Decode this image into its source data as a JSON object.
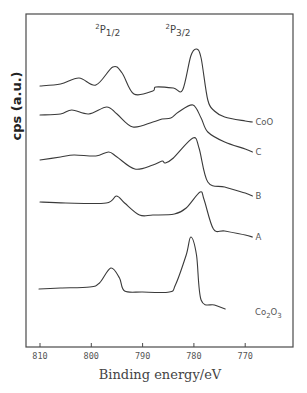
{
  "chart_data": {
    "type": "line",
    "title": "",
    "xlabel": "Binding energy/eV",
    "ylabel": "cps (a.u.)",
    "xlim": [
      813,
      765
    ],
    "x_reversed": true,
    "xticks": [
      810,
      800,
      790,
      780,
      770
    ],
    "xtick_labels": [
      "810",
      "800",
      "790",
      "780",
      "770"
    ],
    "grid": false,
    "legend": "inline labels at right end of each curve",
    "annotations": [
      {
        "text_main": "2",
        "text_base": "P",
        "text_sub": "1/2",
        "x_eV": 796.5,
        "label": "2P1/2"
      },
      {
        "text_main": "2",
        "text_base": "P",
        "text_sub": "3/2",
        "x_eV": 782.8,
        "label": "2P3/2"
      }
    ],
    "series": [
      {
        "name": "CoO",
        "label_main": "CoO",
        "label_sub": "",
        "label_tail": "",
        "points": [
          [
            810,
            86
          ],
          [
            806,
            84
          ],
          [
            802.4,
            78
          ],
          [
            799.1,
            85
          ],
          [
            795.8,
            67
          ],
          [
            794,
            73
          ],
          [
            791.7,
            94
          ],
          [
            788,
            91
          ],
          [
            787.4,
            87
          ],
          [
            784,
            88
          ],
          [
            782.2,
            90
          ],
          [
            780.6,
            56
          ],
          [
            779.5,
            49
          ],
          [
            778.6,
            58
          ],
          [
            777.3,
            100
          ],
          [
            776,
            111
          ],
          [
            774,
            117
          ],
          [
            770,
            121
          ],
          [
            768.6,
            122
          ]
        ]
      },
      {
        "name": "C",
        "label_main": "C",
        "label_sub": "",
        "label_tail": "",
        "points": [
          [
            810,
            115
          ],
          [
            806,
            114
          ],
          [
            803.8,
            110
          ],
          [
            800.5,
            114
          ],
          [
            797,
            107
          ],
          [
            795,
            114
          ],
          [
            791.9,
            127
          ],
          [
            788,
            122
          ],
          [
            786.2,
            119
          ],
          [
            784.5,
            118
          ],
          [
            783,
            112
          ],
          [
            780.2,
            105
          ],
          [
            778.6,
            118
          ],
          [
            777.3,
            132
          ],
          [
            774,
            142
          ],
          [
            770,
            149
          ],
          [
            768.6,
            152
          ]
        ]
      },
      {
        "name": "B",
        "label_main": "B",
        "label_sub": "",
        "label_tail": "",
        "points": [
          [
            810,
            160
          ],
          [
            806,
            157
          ],
          [
            803.4,
            155
          ],
          [
            799.1,
            156
          ],
          [
            796.6,
            152
          ],
          [
            795,
            157
          ],
          [
            791.5,
            169
          ],
          [
            788,
            165
          ],
          [
            786.2,
            161
          ],
          [
            785.6,
            163
          ],
          [
            784,
            158
          ],
          [
            780.2,
            138
          ],
          [
            779,
            148
          ],
          [
            777.3,
            182
          ],
          [
            774,
            187
          ],
          [
            770,
            193
          ],
          [
            768.6,
            196
          ]
        ]
      },
      {
        "name": "A",
        "label_main": "A",
        "label_sub": "",
        "label_tail": "",
        "points": [
          [
            810,
            202
          ],
          [
            805,
            203
          ],
          [
            797.1,
            203
          ],
          [
            795.1,
            196
          ],
          [
            793.5,
            203
          ],
          [
            790.6,
            215
          ],
          [
            788,
            215
          ],
          [
            783.8,
            214
          ],
          [
            781.5,
            208
          ],
          [
            778.8,
            192
          ],
          [
            778,
            200
          ],
          [
            776.2,
            229
          ],
          [
            774,
            231
          ],
          [
            770,
            235
          ],
          [
            768.6,
            237
          ]
        ]
      },
      {
        "name": "Co2O3",
        "label_main": "Co",
        "label_sub": "2",
        "label_tail": "O",
        "label_sub2": "3",
        "points": [
          [
            810.2,
            289
          ],
          [
            806,
            288
          ],
          [
            800.3,
            287
          ],
          [
            798.4,
            283
          ],
          [
            796.2,
            268
          ],
          [
            794.5,
            278
          ],
          [
            793.5,
            291
          ],
          [
            790,
            292
          ],
          [
            784.8,
            292
          ],
          [
            783.6,
            285
          ],
          [
            781.5,
            255
          ],
          [
            780.6,
            237
          ],
          [
            779.5,
            255
          ],
          [
            778.6,
            300
          ],
          [
            776,
            305
          ],
          [
            773.9,
            309
          ]
        ]
      }
    ]
  }
}
